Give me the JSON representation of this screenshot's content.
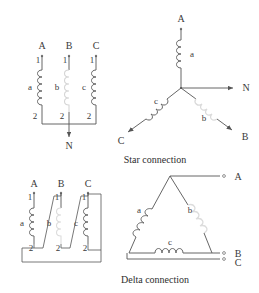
{
  "figure": {
    "title": "",
    "background_color": "#ffffff",
    "line_color": "#555555",
    "coil_color": "#6b6b6b",
    "coil_highlight_color": "#d9d9d9",
    "text_color": "#3a3a3a"
  },
  "captions": {
    "star": "Star connection",
    "delta": "Delta connection"
  },
  "star_winding": {
    "name": "star-winding-diagram",
    "terminals_top": [
      "A",
      "B",
      "C"
    ],
    "terminal_numbers_top": [
      "1",
      "1",
      "1"
    ],
    "coil_labels": [
      "a",
      "b",
      "c"
    ],
    "terminal_numbers_bottom": [
      "2",
      "2",
      "2"
    ],
    "neutral_label": "N"
  },
  "star_vector": {
    "name": "star-connection-diagram",
    "coil_labels": [
      "a",
      "b",
      "c"
    ],
    "terminals": [
      "A",
      "N",
      "B",
      "C"
    ]
  },
  "delta_winding": {
    "name": "delta-winding-diagram",
    "terminals_top": [
      "A",
      "B",
      "C"
    ],
    "terminal_numbers_top": [
      "1",
      "1",
      "1"
    ],
    "coil_labels": [
      "a",
      "b",
      "c"
    ],
    "terminal_numbers_bottom": [
      "2",
      "2",
      "2"
    ]
  },
  "delta_vector": {
    "name": "delta-connection-diagram",
    "coil_labels": [
      "a",
      "b",
      "c"
    ],
    "terminals": [
      "A",
      "B",
      "C"
    ]
  }
}
